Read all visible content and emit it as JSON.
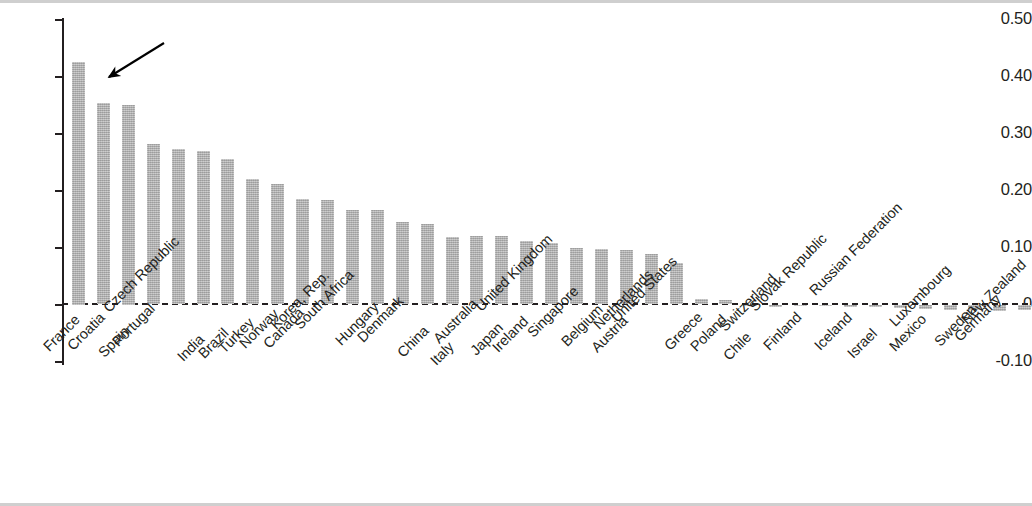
{
  "chart_data": {
    "type": "bar",
    "title": "",
    "subtitle": "",
    "xlabel": "",
    "ylabel": "",
    "ylim": [
      -0.1,
      0.5
    ],
    "ytick_labels": [
      "0.50",
      "0.40",
      "0.30",
      "0.20",
      "0.10",
      "0",
      "-0.10"
    ],
    "ytick_values": [
      0.5,
      0.4,
      0.3,
      0.2,
      0.1,
      0,
      -0.1
    ],
    "grid": false,
    "legend": null,
    "zero_line": true,
    "bar_color": "#a9a9a9",
    "axis_color": "#231f20",
    "categories": [
      "France",
      "Croatia",
      "Spain",
      "Portugal",
      "Czech Republic",
      "India",
      "Brazil",
      "Turkey",
      "Norway",
      "Canada",
      "Korea, Rep.",
      "South Africa",
      "Hungary",
      "Denmark",
      "China",
      "Italy",
      "Australia",
      "Japan",
      "Ireland",
      "United Kingdom",
      "Singapore",
      "Belgium",
      "Austria",
      "Netherlands",
      "United States",
      "Greece",
      "Poland",
      "Chile",
      "Switzerland",
      "Finland",
      "Slovak Republic",
      "Iceland",
      "Israel",
      "Russian Federation",
      "Mexico",
      "Luxembourg",
      "Sweden",
      "Germany",
      "New Zealand"
    ],
    "values": [
      0.425,
      0.353,
      0.35,
      0.281,
      0.272,
      0.27,
      0.255,
      0.22,
      0.212,
      0.185,
      0.184,
      0.165,
      0.165,
      0.145,
      0.142,
      0.119,
      0.12,
      0.12,
      0.112,
      0.108,
      0.099,
      0.098,
      0.096,
      0.089,
      0.073,
      0.01,
      0.008,
      0.0,
      -0.004,
      -0.003,
      -0.003,
      -0.004,
      -0.005,
      -0.006,
      -0.008,
      -0.009,
      -0.01,
      -0.011,
      -0.01
    ],
    "annotations": [
      {
        "type": "arrow",
        "target_category": "Croatia",
        "note": "arrow pointing to Croatia bar"
      }
    ]
  }
}
